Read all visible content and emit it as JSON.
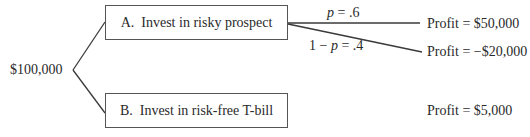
{
  "diagram": {
    "type": "decision-tree",
    "root": {
      "label": "$100,000"
    },
    "options": [
      {
        "id": "A",
        "label": "A.  Invest in risky prospect",
        "branches": [
          {
            "probability_label": "p = .6",
            "prob_var": "p",
            "prob_rest": " = .6",
            "outcome": "Profit = $50,000"
          },
          {
            "probability_label": "1 − p = .4",
            "prob_prefix": "1 − ",
            "prob_var": "p",
            "prob_rest": " = .4",
            "outcome": "Profit = −$20,000"
          }
        ]
      },
      {
        "id": "B",
        "label": "B.  Invest in risk-free T-bill",
        "outcome": "Profit = $5,000"
      }
    ],
    "colors": {
      "line": "#3a3a3a",
      "text": "#2a2a2a",
      "box_border": "#555555",
      "background": "#ffffff"
    }
  }
}
